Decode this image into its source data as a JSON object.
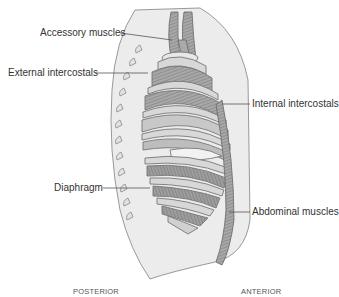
{
  "diagram": {
    "labels": {
      "accessory": "Accessory muscles",
      "external": "External intercostals",
      "internal": "Internal intercostals",
      "diaphragm": "Diaphragm",
      "abdominal": "Abdominal muscles"
    },
    "orientation": {
      "posterior": "POSTERIOR",
      "anterior": "ANTERIOR"
    },
    "colors": {
      "body_fill": "#eaeaea",
      "outline": "#8a8a8a",
      "rib_fill": "#d6d6d6",
      "muscle_fill": "#9a9a9a",
      "text": "#333333"
    }
  }
}
